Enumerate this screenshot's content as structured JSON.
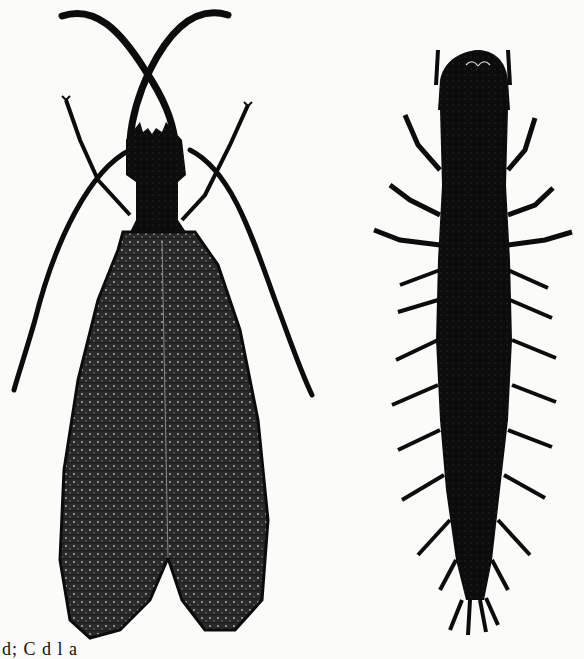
{
  "figure": {
    "ink_color": "#0c0c0c",
    "paper_color": "#fbfbfa",
    "specimens": [
      {
        "name": "adult",
        "position": "left"
      },
      {
        "name": "larva",
        "position": "right"
      }
    ],
    "caption_fragment": "d; C    d  l    a"
  }
}
